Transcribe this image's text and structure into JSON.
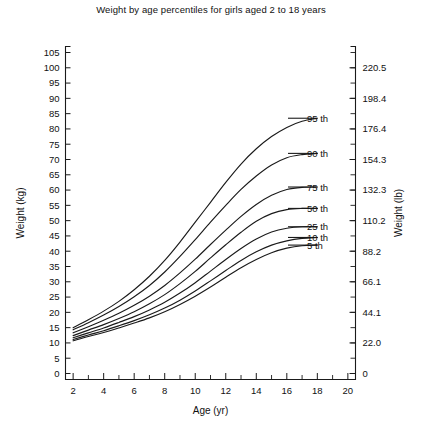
{
  "chart_data": {
    "type": "line",
    "title": "Weight by age percentiles for girls aged 2 to 18 years",
    "xlabel": "Age (yr)",
    "ylabel": "Weight (kg)",
    "ylabel_right": "Weight (lb)",
    "xlim": [
      1.5,
      20.5
    ],
    "ylim": [
      0,
      105
    ],
    "grid": false,
    "legend_position": "inline-right-of-curve-ends",
    "x_ticks_major": [
      2,
      4,
      6,
      8,
      10,
      12,
      14,
      16,
      18,
      20
    ],
    "x_ticks_minor": [
      3,
      5,
      7,
      9,
      11,
      13,
      15,
      17,
      19
    ],
    "y_ticks_left": [
      0,
      5,
      10,
      15,
      20,
      25,
      30,
      35,
      40,
      45,
      50,
      55,
      60,
      65,
      70,
      75,
      80,
      85,
      90,
      95,
      100,
      105
    ],
    "y_ticks_right_kg": [
      0,
      10,
      20,
      30,
      40,
      50,
      60,
      70,
      80,
      90,
      100
    ],
    "y_ticklabels_right": [
      "0",
      "22.0",
      "44.1",
      "66.1",
      "88.2",
      "110.2",
      "132.3",
      "154.3",
      "176.4",
      "198.4",
      "220.5"
    ],
    "x": [
      2,
      3,
      4,
      5,
      6,
      7,
      8,
      9,
      10,
      11,
      12,
      13,
      14,
      15,
      16,
      17,
      18
    ],
    "series": [
      {
        "name": "95 th",
        "label": "95 th",
        "label_y_kg": 83.5,
        "values": [
          15.0,
          17.6,
          20.4,
          23.6,
          27.4,
          31.8,
          37.0,
          43.0,
          49.5,
          56.0,
          62.5,
          68.5,
          73.5,
          77.5,
          80.5,
          82.5,
          83.5
        ]
      },
      {
        "name": "90 th",
        "label": "90 th",
        "label_y_kg": 72.0,
        "values": [
          14.3,
          16.6,
          19.1,
          21.9,
          25.1,
          28.8,
          33.2,
          38.3,
          43.8,
          49.5,
          55.0,
          60.2,
          64.6,
          68.2,
          70.6,
          71.6,
          72.0
        ]
      },
      {
        "name": "75 th",
        "label": "75 th",
        "label_y_kg": 61.0,
        "values": [
          13.3,
          15.3,
          17.4,
          19.7,
          22.3,
          25.3,
          28.8,
          32.9,
          37.4,
          42.2,
          46.9,
          51.4,
          55.3,
          58.3,
          60.2,
          60.9,
          61.0
        ]
      },
      {
        "name": "50 th",
        "label": "50 th",
        "label_y_kg": 54.0,
        "values": [
          12.4,
          14.2,
          16.0,
          18.0,
          20.2,
          22.8,
          25.8,
          29.4,
          33.4,
          37.8,
          42.1,
          46.2,
          49.8,
          52.3,
          53.6,
          54.0,
          54.0
        ]
      },
      {
        "name": "25 th",
        "label": "25 th",
        "label_y_kg": 48.0,
        "values": [
          11.7,
          13.3,
          14.9,
          16.7,
          18.6,
          20.8,
          23.3,
          26.3,
          29.7,
          33.5,
          37.3,
          40.9,
          44.0,
          46.3,
          47.5,
          48.0,
          48.0
        ]
      },
      {
        "name": "10 th",
        "label": "10 th",
        "label_y_kg": 44.5,
        "values": [
          11.1,
          12.6,
          14.0,
          15.6,
          17.3,
          19.2,
          21.4,
          24.0,
          27.0,
          30.3,
          33.7,
          37.0,
          39.8,
          42.0,
          43.4,
          44.2,
          44.5
        ]
      },
      {
        "name": "5 th",
        "label": "5 th",
        "label_y_kg": 42.0,
        "values": [
          10.7,
          12.1,
          13.4,
          14.9,
          16.5,
          18.2,
          20.2,
          22.6,
          25.3,
          28.3,
          31.5,
          34.6,
          37.3,
          39.5,
          41.0,
          41.8,
          42.0
        ]
      }
    ]
  }
}
